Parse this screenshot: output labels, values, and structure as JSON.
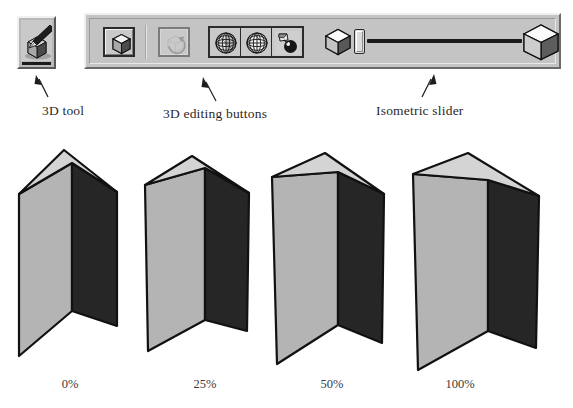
{
  "toolbar": {
    "tool_button": {
      "name": "3D tool",
      "icon": "pen-drawing-cube-icon",
      "state": "selected"
    },
    "buttons": [
      {
        "id": "create-3d-object",
        "label": "3D object",
        "icon": "cube-icon",
        "enabled": true
      },
      {
        "id": "rotate-3d-object",
        "label": "Rotate 3D",
        "icon": "rotate-cube-icon",
        "enabled": false
      },
      {
        "id": "mesh-wireframe",
        "label": "Mesh",
        "icon": "globe-mesh-icon",
        "enabled": true
      },
      {
        "id": "mesh-surface",
        "label": "Surface",
        "icon": "globe-surface-icon",
        "enabled": true
      },
      {
        "id": "lighting",
        "label": "Lighting",
        "icon": "light-sphere-icon",
        "enabled": true
      }
    ],
    "slider": {
      "id": "isometric-slider",
      "label": "Isometric slider",
      "min_icon": "small-cube-icon",
      "max_icon": "large-cube-icon",
      "value": 0,
      "min": 0,
      "max": 100
    }
  },
  "annotations": [
    {
      "id": "anno-3d-tool",
      "text": "3D tool"
    },
    {
      "id": "anno-3d-editing-buttons",
      "text": "3D editing buttons"
    },
    {
      "id": "anno-isometric-slider",
      "text": "Isometric slider"
    }
  ],
  "boxes": [
    {
      "id": "box-0",
      "caption": "0%",
      "value": 0
    },
    {
      "id": "box-25",
      "caption": "25%",
      "value": 25
    },
    {
      "id": "box-50",
      "caption": "50%",
      "value": 50
    },
    {
      "id": "box-100",
      "caption": "100%",
      "value": 100
    }
  ],
  "colors": {
    "top_face": "#d4d4d4",
    "left_face": "#b4b4b4",
    "right_face": "#262626",
    "outline": "#111111",
    "toolbar_face": "#c4c4c4",
    "page_background": "#ffffff"
  }
}
